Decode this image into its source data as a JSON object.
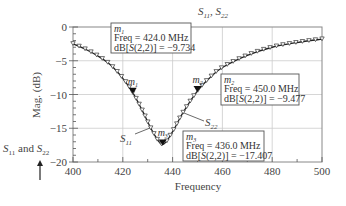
{
  "chart_data": {
    "type": "line",
    "title": "S11, S22",
    "title_main": "S",
    "title_parts": [
      {
        "s": "S",
        "sub": "11"
      },
      {
        "s": "S",
        "sub": "22"
      }
    ],
    "xlabel": "Frequency",
    "ylabel": "Mag. (dB)",
    "xlim": [
      400,
      500
    ],
    "ylim": [
      -20,
      0
    ],
    "x_ticks": [
      400,
      420,
      440,
      460,
      480,
      500
    ],
    "y_ticks": [
      0,
      -5,
      -10,
      -15,
      -20
    ],
    "y_tick_labels": [
      "0",
      "−5",
      "−10",
      "−15",
      "−20"
    ],
    "grid": true,
    "series": [
      {
        "name": "S11",
        "marker": "triangle-down",
        "x": [
          400,
          405,
          410,
          415,
          420,
          424,
          428,
          432,
          436,
          440,
          444,
          450,
          455,
          460,
          470,
          480,
          490,
          500
        ],
        "values": [
          -2.5,
          -3.3,
          -4.3,
          -5.6,
          -7.6,
          -9.734,
          -12.5,
          -15.5,
          -17.407,
          -15.5,
          -12.8,
          -9.477,
          -7.5,
          -6.0,
          -4.2,
          -3.0,
          -2.3,
          -1.8
        ]
      },
      {
        "name": "S22",
        "marker": "line",
        "x": [
          400,
          405,
          410,
          415,
          420,
          424,
          428,
          432,
          436,
          440,
          444,
          450,
          455,
          460,
          470,
          480,
          490,
          500
        ],
        "values": [
          -2.5,
          -3.3,
          -4.3,
          -5.6,
          -7.6,
          -9.734,
          -12.5,
          -15.5,
          -17.407,
          -15.5,
          -12.8,
          -9.477,
          -7.5,
          -6.0,
          -4.2,
          -3.0,
          -2.3,
          -1.8
        ]
      }
    ],
    "markers": [
      {
        "id": "m1",
        "label": "m",
        "sub": "1",
        "freq": "Freq = 424.0 MHz",
        "val_prefix": "dB[",
        "val_s": "S",
        "val_args": "(2,2)] = −9.734",
        "x": 424,
        "y": -9.734
      },
      {
        "id": "m2",
        "label": "m",
        "sub": "2",
        "freq": "Freq = 450.0 MHz",
        "val_prefix": "dB[",
        "val_s": "S",
        "val_args": "(2,2)] = −9.477",
        "x": 450,
        "y": -9.477
      },
      {
        "id": "m3",
        "label": "m",
        "sub": "3",
        "freq": "Freq = 436.0 MHz",
        "val_prefix": "dB[",
        "val_s": "S",
        "val_args": "(2,2)] = −17.407",
        "x": 436,
        "y": -17.407
      }
    ],
    "annotations": [
      {
        "text": "S",
        "sub": "11",
        "role": "curve-label-s11"
      },
      {
        "text": "S",
        "sub": "22",
        "role": "curve-label-s22"
      },
      {
        "text": "S11 and S22",
        "role": "side-note-with-arrow"
      }
    ],
    "side_note": {
      "s1": "S",
      "sub1": "11",
      "mid": " and ",
      "s2": "S",
      "sub2": "22"
    }
  }
}
